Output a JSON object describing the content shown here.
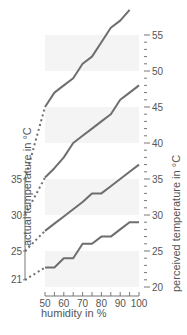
{
  "chart_data": {
    "type": "line",
    "title": "",
    "xlabel": "humidity in %",
    "ylabel_left": "actual temperature in °C",
    "ylabel_right": "perceived temperature in °C",
    "x_ticks": [
      50,
      60,
      70,
      80,
      90,
      100
    ],
    "xlim": [
      50,
      100
    ],
    "left_ticks": [
      21,
      25,
      30,
      35
    ],
    "right_ticks": [
      20,
      25,
      30,
      35,
      40,
      45,
      50,
      55
    ],
    "ylim": [
      20,
      60
    ],
    "shaded_bands": [
      [
        20,
        25
      ],
      [
        30,
        35
      ],
      [
        40,
        45
      ],
      [
        50,
        55
      ]
    ],
    "x": [
      50,
      55,
      60,
      65,
      70,
      75,
      80,
      85,
      90,
      95,
      100
    ],
    "series": [
      {
        "name": "21 °C",
        "actual": 21,
        "values": [
          22.7,
          22.7,
          24,
          24,
          26,
          26,
          27,
          27,
          28,
          29,
          29
        ]
      },
      {
        "name": "25 °C",
        "actual": 25,
        "values": [
          27.8,
          28.8,
          29.8,
          30.8,
          31.8,
          33,
          33,
          34,
          35,
          36,
          37
        ]
      },
      {
        "name": "30 °C",
        "actual": 30,
        "values": [
          35.2,
          36.5,
          38,
          40,
          41,
          42,
          43,
          44,
          46,
          47,
          48
        ]
      },
      {
        "name": "35 °C",
        "actual": 35,
        "values": [
          45,
          47,
          48,
          49,
          51,
          52,
          54,
          56,
          57,
          58.5,
          null
        ]
      }
    ]
  },
  "labels": {
    "xlabel": "humidity in %",
    "ylabel_left": "actual temperature in °C",
    "ylabel_right": "perceived temperature in °C"
  },
  "colors": {
    "line": "#6e6e6e",
    "band": "#f4f4f4",
    "axis": "#777777",
    "text": "#555555"
  }
}
